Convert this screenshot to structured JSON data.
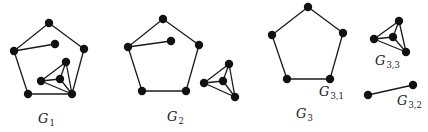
{
  "diagram": {
    "title": "",
    "node_radius": 4.2,
    "colors": {
      "edge": "#1a1a1a",
      "node": "#111111",
      "background": "#ffffff"
    },
    "graphs": [
      {
        "id": "G1",
        "label": {
          "main": "G",
          "sub": "1",
          "x": 38,
          "y": 123
        },
        "nodes": [
          {
            "id": "a",
            "x": 49,
            "y": 23
          },
          {
            "id": "b",
            "x": 14,
            "y": 51
          },
          {
            "id": "c",
            "x": 84,
            "y": 49
          },
          {
            "id": "d",
            "x": 28,
            "y": 94
          },
          {
            "id": "e",
            "x": 72,
            "y": 94
          },
          {
            "id": "f",
            "x": 55,
            "y": 44
          },
          {
            "id": "g",
            "x": 66,
            "y": 62
          },
          {
            "id": "h",
            "x": 41,
            "y": 81
          },
          {
            "id": "i",
            "x": 60,
            "y": 79
          }
        ],
        "edges": [
          [
            "a",
            "b"
          ],
          [
            "a",
            "c"
          ],
          [
            "b",
            "d"
          ],
          [
            "c",
            "e"
          ],
          [
            "d",
            "e"
          ],
          [
            "b",
            "f"
          ],
          [
            "h",
            "g"
          ],
          [
            "h",
            "i"
          ],
          [
            "h",
            "e"
          ],
          [
            "g",
            "i"
          ],
          [
            "g",
            "e"
          ],
          [
            "i",
            "e"
          ]
        ]
      },
      {
        "id": "G2",
        "label": {
          "main": "G",
          "sub": "2",
          "x": 167,
          "y": 121
        },
        "nodes": [
          {
            "id": "a",
            "x": 163,
            "y": 19
          },
          {
            "id": "b",
            "x": 128,
            "y": 47
          },
          {
            "id": "c",
            "x": 199,
            "y": 45
          },
          {
            "id": "d",
            "x": 142,
            "y": 91
          },
          {
            "id": "e",
            "x": 186,
            "y": 91
          },
          {
            "id": "f",
            "x": 171,
            "y": 41
          },
          {
            "id": "g",
            "x": 229,
            "y": 64
          },
          {
            "id": "h",
            "x": 204,
            "y": 83
          },
          {
            "id": "i",
            "x": 223,
            "y": 81
          },
          {
            "id": "j",
            "x": 235,
            "y": 97
          }
        ],
        "edges": [
          [
            "a",
            "b"
          ],
          [
            "a",
            "c"
          ],
          [
            "b",
            "d"
          ],
          [
            "c",
            "e"
          ],
          [
            "d",
            "e"
          ],
          [
            "b",
            "f"
          ],
          [
            "h",
            "g"
          ],
          [
            "h",
            "i"
          ],
          [
            "h",
            "j"
          ],
          [
            "g",
            "i"
          ],
          [
            "g",
            "j"
          ],
          [
            "i",
            "j"
          ]
        ]
      },
      {
        "id": "G3",
        "label": {
          "main": "G",
          "sub": "3",
          "x": 296,
          "y": 118
        },
        "components": [
          {
            "id": "G3,1",
            "label": {
              "main": "G",
              "sub": "3,1",
              "x": 319,
              "y": 96
            },
            "nodes": [
              {
                "id": "a",
                "x": 308,
                "y": 7
              },
              {
                "id": "b",
                "x": 272,
                "y": 35
              },
              {
                "id": "c",
                "x": 343,
                "y": 33
              },
              {
                "id": "d",
                "x": 287,
                "y": 79
              },
              {
                "id": "e",
                "x": 330,
                "y": 79
              }
            ],
            "edges": [
              [
                "a",
                "b"
              ],
              [
                "a",
                "c"
              ],
              [
                "b",
                "d"
              ],
              [
                "c",
                "e"
              ],
              [
                "d",
                "e"
              ]
            ]
          },
          {
            "id": "G3,3",
            "label": {
              "main": "G",
              "sub": "3,3",
              "x": 375,
              "y": 65
            },
            "nodes": [
              {
                "id": "a",
                "x": 399,
                "y": 21
              },
              {
                "id": "b",
                "x": 374,
                "y": 39
              },
              {
                "id": "c",
                "x": 393,
                "y": 37
              },
              {
                "id": "d",
                "x": 406,
                "y": 52
              }
            ],
            "edges": [
              [
                "b",
                "a"
              ],
              [
                "b",
                "c"
              ],
              [
                "b",
                "d"
              ],
              [
                "a",
                "c"
              ],
              [
                "a",
                "d"
              ],
              [
                "c",
                "d"
              ]
            ]
          },
          {
            "id": "G3,2",
            "label": {
              "main": "G",
              "sub": "3,2",
              "x": 397,
              "y": 105
            },
            "nodes": [
              {
                "id": "a",
                "x": 368,
                "y": 95
              },
              {
                "id": "b",
                "x": 413,
                "y": 85
              }
            ],
            "edges": [
              [
                "a",
                "b"
              ]
            ]
          }
        ]
      }
    ]
  }
}
